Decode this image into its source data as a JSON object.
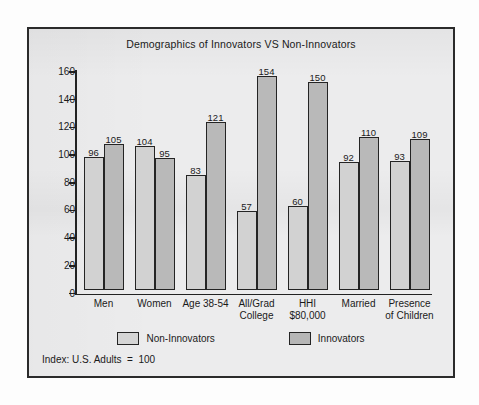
{
  "chart_data": {
    "type": "bar",
    "title": "Demographics of Innovators VS Non-Innovators",
    "xlabel": "",
    "ylabel": "",
    "ylim": [
      0,
      160
    ],
    "yticks": [
      0,
      20,
      40,
      60,
      80,
      100,
      120,
      140,
      160
    ],
    "grid": false,
    "legend_position": "bottom-center",
    "categories": [
      "Men",
      "Women",
      "Age 38-54",
      "All/Grad\nCollege",
      "HHI\n$80,000",
      "Married",
      "Presence\nof Children"
    ],
    "category_lines": [
      [
        "Men"
      ],
      [
        "Women"
      ],
      [
        "Age 38-54"
      ],
      [
        "All/Grad",
        "College"
      ],
      [
        "HHI",
        "$80,000"
      ],
      [
        "Married"
      ],
      [
        "Presence",
        "of Children"
      ]
    ],
    "series": [
      {
        "name": "Non-Innovators",
        "color": "#d2d2d2",
        "values": [
          96,
          104,
          83,
          57,
          60,
          92,
          93
        ]
      },
      {
        "name": "Innovators",
        "color": "#b9b9b9",
        "values": [
          105,
          95,
          121,
          154,
          150,
          110,
          109
        ]
      }
    ],
    "annotation": "Index: U.S. Adults  =  100"
  },
  "colors": {
    "card_background": "#ececed",
    "page_background": "#fdfdfd",
    "border": "#2b2b2b",
    "axis": "#222222",
    "non_innovators_fill": "#d2d2d2",
    "innovators_fill": "#b9b9b9"
  }
}
